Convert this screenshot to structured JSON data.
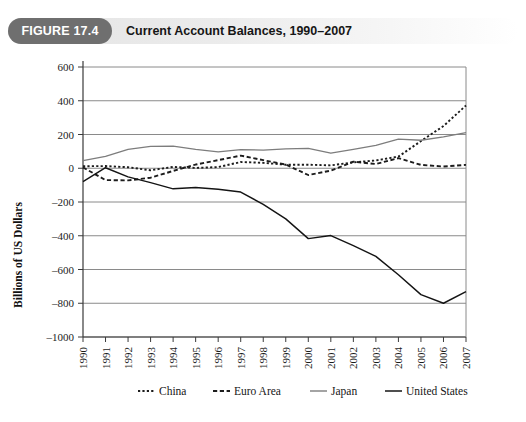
{
  "figure": {
    "badge": "FIGURE 17.4",
    "title": "Current Account Balances, 1990–2007"
  },
  "chart_data": {
    "type": "line",
    "title": "Current Account Balances, 1990–2007",
    "xlabel": "",
    "ylabel": "Billions of US Dollars",
    "categories": [
      "1990",
      "1991",
      "1992",
      "1993",
      "1994",
      "1995",
      "1996",
      "1997",
      "1998",
      "1999",
      "2000",
      "2001",
      "2002",
      "2003",
      "2004",
      "2005",
      "2006",
      "2007"
    ],
    "x": [
      1990,
      1991,
      1992,
      1993,
      1994,
      1995,
      1996,
      1997,
      1998,
      1999,
      2000,
      2001,
      2002,
      2003,
      2004,
      2005,
      2006,
      2007
    ],
    "ylim": [
      -1000,
      600
    ],
    "xlim": [
      1990,
      2007
    ],
    "yticks": [
      600,
      400,
      200,
      0,
      -200,
      -400,
      -600,
      -800,
      -1000
    ],
    "ytick_labels": [
      "600",
      "400",
      "200",
      "0",
      "–200",
      "–400",
      "–600",
      "–800",
      "–1000"
    ],
    "grid": true,
    "legend_position": "bottom",
    "series": [
      {
        "name": "China",
        "style": "dotted",
        "color": "#1c1c1c",
        "values": [
          12,
          13,
          6,
          -12,
          8,
          2,
          7,
          37,
          32,
          21,
          21,
          17,
          35,
          46,
          69,
          161,
          250,
          372
        ]
      },
      {
        "name": "Euro Area",
        "style": "dashed",
        "color": "#1c1c1c",
        "values": [
          5,
          -70,
          -72,
          -56,
          -16,
          22,
          48,
          75,
          48,
          22,
          -40,
          -14,
          39,
          25,
          60,
          20,
          10,
          20
        ]
      },
      {
        "name": "Japan",
        "style": "solid",
        "color": "#7d7d7d",
        "values": [
          45,
          70,
          112,
          130,
          131,
          112,
          97,
          110,
          108,
          115,
          118,
          89,
          112,
          136,
          172,
          166,
          186,
          211
        ]
      },
      {
        "name": "United States",
        "style": "solid",
        "color": "#141414",
        "values": [
          -79,
          3,
          -51,
          -85,
          -122,
          -114,
          -125,
          -141,
          -214,
          -300,
          -417,
          -399,
          -459,
          -522,
          -631,
          -749,
          -800,
          -731
        ]
      }
    ]
  },
  "legend": {
    "items": [
      {
        "label": "China",
        "style": "dotted"
      },
      {
        "label": "Euro Area",
        "style": "dashed"
      },
      {
        "label": "Japan",
        "style": "solid-gray"
      },
      {
        "label": "United States",
        "style": "solid-dark"
      }
    ]
  }
}
